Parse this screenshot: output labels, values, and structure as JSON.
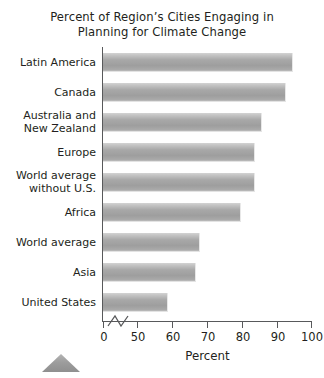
{
  "chart_data": {
    "type": "bar",
    "orientation": "horizontal",
    "title_line1": "Percent of Region’s Cities Engaging in",
    "title_line2": "Planning for Climate Change",
    "xlabel": "Percent",
    "ylabel": "",
    "xlim": [
      0,
      100
    ],
    "axis_break": true,
    "axis_break_note": "x axis is broken between 0 and 50",
    "grid": false,
    "legend": false,
    "xticks": [
      0,
      50,
      60,
      70,
      80,
      90,
      100
    ],
    "xticklabels": [
      "0",
      "50",
      "60",
      "70",
      "80",
      "90",
      "100"
    ],
    "categories": [
      "Latin America",
      "Canada",
      "Australia and New Zealand",
      "Europe",
      "World average without U.S.",
      "Africa",
      "World average",
      "Asia",
      "United States"
    ],
    "values": [
      95,
      93,
      86,
      84,
      84,
      80,
      68,
      67,
      59
    ],
    "bars": [
      {
        "label_line1": "Latin America",
        "label_line2": "",
        "value": 95
      },
      {
        "label_line1": "Canada",
        "label_line2": "",
        "value": 93
      },
      {
        "label_line1": "Australia and",
        "label_line2": "New Zealand",
        "value": 86
      },
      {
        "label_line1": "Europe",
        "label_line2": "",
        "value": 84
      },
      {
        "label_line1": "World average",
        "label_line2": "without U.S.",
        "value": 84
      },
      {
        "label_line1": "Africa",
        "label_line2": "",
        "value": 80
      },
      {
        "label_line1": "World average",
        "label_line2": "",
        "value": 68
      },
      {
        "label_line1": "Asia",
        "label_line2": "",
        "value": 67
      },
      {
        "label_line1": "United States",
        "label_line2": "",
        "value": 59
      }
    ],
    "colors": {
      "bar_fill_light": "#d3d3d3",
      "bar_fill_mid": "#a8a8a8",
      "bar_fill_dark": "#9e9e9e",
      "axis": "#58595b",
      "text": "#231f20",
      "marker": "#9a9a9a",
      "background": "#ffffff"
    }
  },
  "marker": {
    "name": "triangle-marker"
  }
}
